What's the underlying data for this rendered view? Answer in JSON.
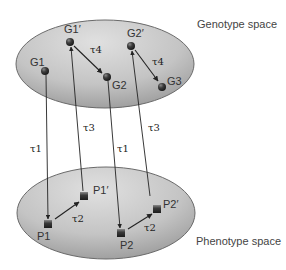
{
  "spaces": {
    "genotype": {
      "label": "Genotype space",
      "center": [
        105,
        64
      ],
      "rx": 89,
      "ry": 44
    },
    "phenotype": {
      "label": "Phenotype space",
      "center": [
        106,
        213
      ],
      "rx": 89,
      "ry": 46
    }
  },
  "colors": {
    "ellipse_fill_light": "#d6d6d6",
    "ellipse_fill_dark": "#9a9a9a",
    "ellipse_stroke": "#6a6a6a",
    "node_fill": "#3a3a3a",
    "arrow": "#222222"
  },
  "genotype_nodes": [
    {
      "id": "G1",
      "label": "G1",
      "x": 45,
      "y": 71
    },
    {
      "id": "G1p",
      "label": "G1′",
      "x": 70,
      "y": 42
    },
    {
      "id": "G2",
      "label": "G2",
      "x": 107,
      "y": 77
    },
    {
      "id": "G2p",
      "label": "G2′",
      "x": 131,
      "y": 46
    },
    {
      "id": "G3",
      "label": "G3",
      "x": 162,
      "y": 87
    }
  ],
  "phenotype_nodes": [
    {
      "id": "P1",
      "label": "P1",
      "x": 48,
      "y": 224
    },
    {
      "id": "P1p",
      "label": "P1′",
      "x": 84,
      "y": 196
    },
    {
      "id": "P2",
      "label": "P2",
      "x": 121,
      "y": 233
    },
    {
      "id": "P2p",
      "label": "P2′",
      "x": 157,
      "y": 209
    }
  ],
  "edges": [
    {
      "from": "G1",
      "to": "P1",
      "label": "τ1"
    },
    {
      "from": "P1",
      "to": "P1p",
      "label": "τ2"
    },
    {
      "from": "P1p",
      "to": "G1p",
      "label": "τ3"
    },
    {
      "from": "G1p",
      "to": "G2",
      "label": "τ4"
    },
    {
      "from": "G2",
      "to": "P2",
      "label": "τ1"
    },
    {
      "from": "P2",
      "to": "P2p",
      "label": "τ2"
    },
    {
      "from": "P2p",
      "to": "G2p",
      "label": "τ3"
    },
    {
      "from": "G2p",
      "to": "G3",
      "label": "τ4"
    }
  ],
  "labels": {
    "genotype_space": "Genotype space",
    "phenotype_space": "Phenotype space",
    "G1": "G1",
    "G1p": "G1′",
    "G2": "G2",
    "G2p": "G2′",
    "G3": "G3",
    "P1": "P1",
    "P1p": "P1′",
    "P2": "P2",
    "P2p": "P2′",
    "tau1_a": "τ1",
    "tau1_b": "τ1",
    "tau2_a": "τ2",
    "tau2_b": "τ2",
    "tau3_a": "τ3",
    "tau3_b": "τ3",
    "tau4_a": "τ4",
    "tau4_b": "τ4"
  }
}
